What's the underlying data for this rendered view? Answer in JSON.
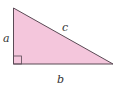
{
  "diagram": {
    "type": "right-triangle",
    "fill_color": "#f4c6dc",
    "stroke_color": "#5a4a55",
    "labels": {
      "leg_vertical": "a",
      "hypotenuse": "c",
      "leg_horizontal": "b"
    },
    "right_angle_marker": true
  }
}
